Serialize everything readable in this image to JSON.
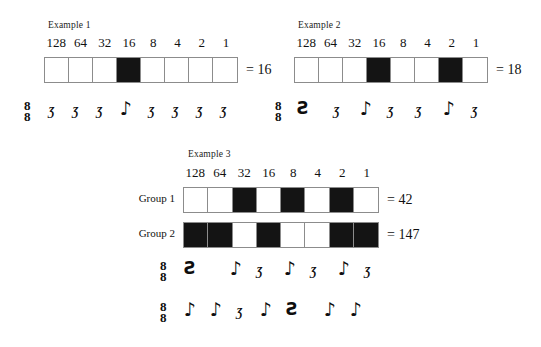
{
  "page": {
    "background": "#ffffff",
    "ink": "#141414",
    "cell_on_color": "#141414",
    "cell_off_color": "#ffffff",
    "border_color": "#8c8c8c"
  },
  "bit_labels": [
    "128",
    "64",
    "32",
    "16",
    "8",
    "4",
    "2",
    "1"
  ],
  "examples": [
    {
      "title": "Example 1",
      "rows": [
        {
          "row_label": "",
          "bits": [
            0,
            0,
            0,
            1,
            0,
            0,
            0,
            0
          ],
          "equals": "= 16",
          "value": 16
        }
      ],
      "music": [
        {
          "time_signature_top": "8",
          "time_signature_bottom": "8",
          "glyphs": [
            "rest8",
            "rest8",
            "rest8",
            "note8",
            "rest8",
            "rest8",
            "rest8",
            "rest8"
          ]
        }
      ]
    },
    {
      "title": "Example 2",
      "rows": [
        {
          "row_label": "",
          "bits": [
            0,
            0,
            0,
            1,
            0,
            0,
            1,
            0
          ],
          "equals": "= 18",
          "value": 18
        }
      ],
      "music": [
        {
          "time_signature_top": "8",
          "time_signature_bottom": "8",
          "glyphs": [
            "rest4",
            "rest8",
            "note8",
            "rest8",
            "rest8",
            "note8",
            "rest8"
          ]
        }
      ]
    },
    {
      "title": "Example 3",
      "rows": [
        {
          "row_label": "Group 1",
          "bits": [
            0,
            0,
            1,
            0,
            1,
            0,
            1,
            0
          ],
          "equals": "= 42",
          "value": 42
        },
        {
          "row_label": "Group 2",
          "bits": [
            1,
            1,
            0,
            1,
            0,
            0,
            1,
            1
          ],
          "equals": "= 147",
          "value": 147
        }
      ],
      "music": [
        {
          "time_signature_top": "8",
          "time_signature_bottom": "8",
          "glyphs": [
            "rest4",
            "note8",
            "rest8",
            "note8",
            "rest8",
            "note8",
            "rest8"
          ]
        },
        {
          "time_signature_top": "8",
          "time_signature_bottom": "8",
          "glyphs": [
            "note8",
            "note8",
            "rest8",
            "note8",
            "rest4",
            "note8",
            "note8"
          ]
        }
      ]
    }
  ],
  "glyph_chars": {
    "note8": "♪",
    "rest8": "Ʒ",
    "rest4": "Ƨ"
  }
}
